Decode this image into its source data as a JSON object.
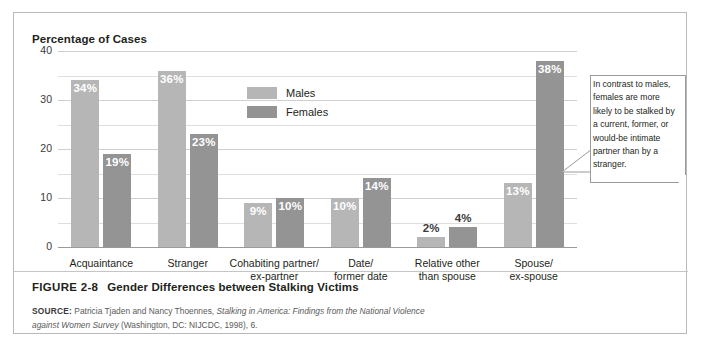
{
  "axis_title": "Percentage of Cases",
  "legend": {
    "males_label": "Males",
    "females_label": "Females"
  },
  "callout": {
    "text": "In contrast to males, females are more likely to be stalked by a current, former, or would-be intimate partner than by a stranger."
  },
  "caption": {
    "figure_number": "FIGURE 2-8",
    "title": "Gender Differences between Stalking Victims"
  },
  "source": {
    "label": "SOURCE:",
    "text_1": " Patricia Tjaden and Nancy Thoennes, ",
    "italic_1": "Stalking in America: Findings from the National Violence against Women Survey",
    "text_2": " (Washington, DC: NIJCDC, 1998), 6."
  },
  "colors": {
    "males": "#b6b6b6",
    "females": "#949494",
    "gridline": "#cfcfcf",
    "border": "#b9b9b9",
    "text": "#231f20"
  },
  "chart_data": {
    "type": "bar",
    "title": "Gender Differences between Stalking Victims",
    "xlabel": "",
    "ylabel": "Percentage of Cases",
    "ylim": [
      0,
      40
    ],
    "yticks": [
      0,
      10,
      20,
      30,
      40
    ],
    "ytick_labels": [
      "0",
      "10",
      "20",
      "30",
      "40"
    ],
    "grid": true,
    "minor_gridlines": true,
    "legend_position": "top-center",
    "categories": [
      "Acquaintance",
      "Stranger",
      "Cohabiting partner/\nex-partner",
      "Date/\nformer date",
      "Relative other\nthan spouse",
      "Spouse/\nex-spouse"
    ],
    "series": [
      {
        "name": "Males",
        "color": "#b6b6b6",
        "values": [
          34,
          36,
          9,
          10,
          2,
          13
        ],
        "labels": [
          "34%",
          "36%",
          "9%",
          "10%",
          "2%",
          "13%"
        ]
      },
      {
        "name": "Females",
        "color": "#949494",
        "values": [
          19,
          23,
          10,
          14,
          4,
          38
        ],
        "labels": [
          "19%",
          "23%",
          "10%",
          "14%",
          "4%",
          "38%"
        ]
      }
    ],
    "annotations": [
      "In contrast to males, females are more likely to be stalked by a current, former, or would-be intimate partner than by a stranger."
    ]
  }
}
